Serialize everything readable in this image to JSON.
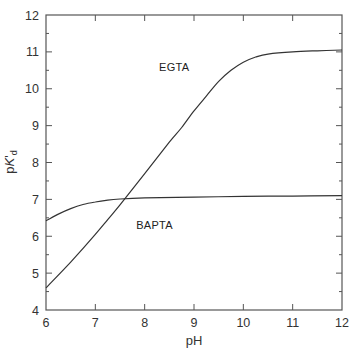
{
  "chart_data": {
    "type": "line",
    "title": "",
    "xlabel": "pH",
    "ylabel": "pK'd",
    "ylabel_parts": {
      "p": "p",
      "K": "K",
      "prime": "'",
      "sub": "d"
    },
    "xlim": [
      6,
      12
    ],
    "ylim": [
      4,
      12
    ],
    "x_ticks": [
      6,
      7,
      8,
      9,
      10,
      11,
      12
    ],
    "y_ticks": [
      4,
      5,
      6,
      7,
      8,
      9,
      10,
      11,
      12
    ],
    "y_minor_ticks": true,
    "grid": false,
    "legend": "inline labels",
    "series": [
      {
        "name": "EGTA",
        "label_pos": {
          "x": 8.6,
          "y": 10.6
        },
        "points": [
          [
            6.0,
            4.6
          ],
          [
            6.5,
            5.3
          ],
          [
            7.0,
            6.05
          ],
          [
            7.25,
            6.45
          ],
          [
            7.5,
            6.85
          ],
          [
            8.0,
            7.7
          ],
          [
            8.5,
            8.55
          ],
          [
            8.75,
            8.95
          ],
          [
            9.0,
            9.4
          ],
          [
            9.25,
            9.8
          ],
          [
            9.5,
            10.2
          ],
          [
            9.75,
            10.5
          ],
          [
            10.0,
            10.72
          ],
          [
            10.25,
            10.86
          ],
          [
            10.5,
            10.94
          ],
          [
            11.0,
            11.0
          ],
          [
            11.5,
            11.03
          ],
          [
            12.0,
            11.05
          ]
        ]
      },
      {
        "name": "BAPTA",
        "label_pos": {
          "x": 8.2,
          "y": 6.3
        },
        "points": [
          [
            6.0,
            6.42
          ],
          [
            6.25,
            6.6
          ],
          [
            6.5,
            6.75
          ],
          [
            6.75,
            6.86
          ],
          [
            7.0,
            6.93
          ],
          [
            7.25,
            6.98
          ],
          [
            7.5,
            7.01
          ],
          [
            8.0,
            7.04
          ],
          [
            9.0,
            7.06
          ],
          [
            10.0,
            7.08
          ],
          [
            11.0,
            7.09
          ],
          [
            12.0,
            7.1
          ]
        ]
      }
    ]
  },
  "colors": {
    "axis": "#555555",
    "curve": "#333333",
    "text": "#333333",
    "background": "#ffffff"
  }
}
